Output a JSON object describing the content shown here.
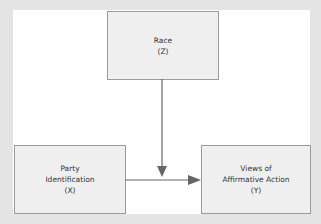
{
  "diagram": {
    "nodes": [
      {
        "id": "Z",
        "lines": [
          "Race",
          "(Z)"
        ]
      },
      {
        "id": "X",
        "lines": [
          "Party",
          "Identification",
          "(X)"
        ]
      },
      {
        "id": "Y",
        "lines": [
          "Views of",
          "Affirmative Action",
          "(Y)"
        ]
      }
    ],
    "edges": [
      {
        "from": "Z",
        "to": "X->Y edge"
      },
      {
        "from": "X",
        "to": "Y"
      }
    ],
    "colors": {
      "background": "#e4e4e4",
      "panel": "#ffffff",
      "box_fill": "#efefef",
      "box_border": "#9a9a9a",
      "arrow": "#666666"
    }
  }
}
